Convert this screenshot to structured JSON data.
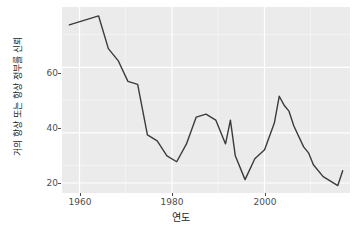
{
  "chart_data": {
    "type": "line",
    "title": "",
    "xlabel": "연도",
    "ylabel": "거의 항상 또는 항상 정부를 신뢰",
    "xlim": [
      1956.5,
      2015.5
    ],
    "ylim": [
      16.5,
      79.0
    ],
    "xticks": [
      1960,
      1980,
      2000
    ],
    "xtick_labels": [
      "1960",
      "1980",
      "2000"
    ],
    "yticks": [
      20,
      40,
      60
    ],
    "ytick_labels": [
      "20",
      "40",
      "60"
    ],
    "grid": "major and minor white gridlines on grey panel",
    "legend": "none",
    "line_color": "#3b3b3b",
    "panel_color": "#ebebeb",
    "gridline_color": "#ffffff",
    "series": [
      {
        "name": "거의 항상 또는 항상 정부를 신뢰",
        "x": [
          1958,
          1964,
          1966,
          1968,
          1970,
          1972,
          1974,
          1976,
          1978,
          1980,
          1982,
          1984,
          1986,
          1988,
          1990,
          1991,
          1992,
          1994,
          1996,
          1998,
          2000,
          2001,
          2002,
          2003,
          2004,
          2006,
          2007,
          2008,
          2010,
          2011,
          2013,
          2014
        ],
        "values": [
          73,
          76,
          65,
          61,
          54,
          53,
          36,
          34,
          29,
          27,
          33,
          42,
          43,
          41,
          33,
          41,
          29,
          21,
          28,
          31,
          40,
          49,
          46,
          44,
          39,
          32,
          30,
          26,
          22,
          21,
          19,
          24
        ]
      }
    ]
  },
  "axes": {
    "y_ticks": [
      {
        "label": "60",
        "value": 60
      },
      {
        "label": "40",
        "value": 40
      },
      {
        "label": "20",
        "value": 20
      }
    ],
    "x_ticks": [
      {
        "label": "1960",
        "value": 1960
      },
      {
        "label": "1980",
        "value": 1980
      },
      {
        "label": "2000",
        "value": 2000
      }
    ]
  }
}
